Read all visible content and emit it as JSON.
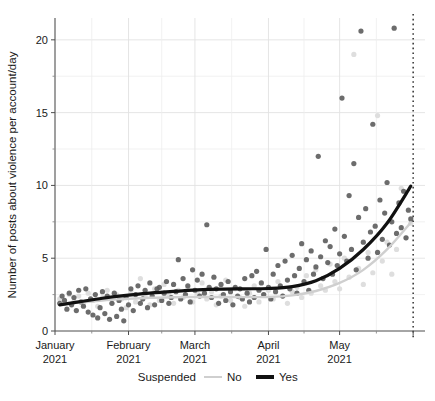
{
  "chart_data": {
    "type": "scatter",
    "title": "",
    "xlabel": "",
    "ylabel": "Number of posts about violence per account/day",
    "xlim": [
      "2021-01-01",
      "2021-06-05"
    ],
    "ylim": [
      0,
      21.5
    ],
    "grid": true,
    "y_ticks_major": [
      0,
      5,
      10,
      15,
      20
    ],
    "y_ticks_minor": [
      2.5,
      7.5,
      12.5,
      17.5
    ],
    "x_tick_labels": [
      {
        "label": "January",
        "sub": "2021",
        "value": "2021-01-01"
      },
      {
        "label": "February",
        "sub": "2021",
        "value": "2021-02-01"
      },
      {
        "label": "March",
        "sub": "2021",
        "value": "2021-03-01"
      },
      {
        "label": "April",
        "sub": "2021",
        "value": "2021-04-01"
      },
      {
        "label": "May",
        "sub": "2021",
        "value": "2021-05-01"
      }
    ],
    "legend": {
      "title": "Suspended",
      "position": "bottom",
      "entries": [
        {
          "label": "No",
          "color": "#cfcfcf",
          "line_width": 2
        },
        {
          "label": "Yes",
          "color": "#111111",
          "line_width": 4
        }
      ]
    },
    "annotations": [
      {
        "type": "vline",
        "x": "2021-06-01",
        "style": "dotted",
        "color": "#111111"
      }
    ],
    "series": [
      {
        "name": "Yes",
        "marker_color": "#5c5c5c",
        "line_color": "#111111",
        "points": [
          [
            2,
            1.9
          ],
          [
            3,
            2.4
          ],
          [
            4,
            2.1
          ],
          [
            5,
            1.5
          ],
          [
            6,
            2.6
          ],
          [
            7,
            1.8
          ],
          [
            8,
            2.3
          ],
          [
            9,
            1.4
          ],
          [
            10,
            2.8
          ],
          [
            11,
            2.0
          ],
          [
            12,
            1.7
          ],
          [
            13,
            2.9
          ],
          [
            14,
            1.3
          ],
          [
            15,
            2.2
          ],
          [
            16,
            1.1
          ],
          [
            17,
            2.5
          ],
          [
            18,
            0.9
          ],
          [
            19,
            1.6
          ],
          [
            20,
            2.7
          ],
          [
            21,
            1.2
          ],
          [
            22,
            2.4
          ],
          [
            23,
            0.8
          ],
          [
            24,
            1.9
          ],
          [
            25,
            2.6
          ],
          [
            26,
            1.0
          ],
          [
            27,
            2.1
          ],
          [
            28,
            1.5
          ],
          [
            29,
            0.7
          ],
          [
            30,
            2.3
          ],
          [
            31,
            1.8
          ],
          [
            32,
            2.9
          ],
          [
            33,
            1.4
          ],
          [
            34,
            2.5
          ],
          [
            35,
            3.1
          ],
          [
            36,
            1.9
          ],
          [
            37,
            2.2
          ],
          [
            38,
            2.8
          ],
          [
            39,
            1.6
          ],
          [
            40,
            3.3
          ],
          [
            41,
            2.4
          ],
          [
            42,
            1.8
          ],
          [
            43,
            2.9
          ],
          [
            44,
            3.0
          ],
          [
            45,
            2.1
          ],
          [
            46,
            2.6
          ],
          [
            47,
            3.4
          ],
          [
            48,
            1.9
          ],
          [
            49,
            2.3
          ],
          [
            50,
            3.2
          ],
          [
            51,
            2.7
          ],
          [
            52,
            4.9
          ],
          [
            53,
            2.2
          ],
          [
            54,
            3.6
          ],
          [
            55,
            2.5
          ],
          [
            56,
            3.1
          ],
          [
            57,
            2.0
          ],
          [
            58,
            4.2
          ],
          [
            59,
            2.8
          ],
          [
            60,
            3.5
          ],
          [
            61,
            2.4
          ],
          [
            62,
            3.9
          ],
          [
            63,
            2.6
          ],
          [
            64,
            7.3
          ],
          [
            65,
            3.0
          ],
          [
            66,
            2.3
          ],
          [
            67,
            3.7
          ],
          [
            68,
            2.9
          ],
          [
            69,
            1.9
          ],
          [
            70,
            3.2
          ],
          [
            71,
            2.5
          ],
          [
            72,
            2.1
          ],
          [
            73,
            3.4
          ],
          [
            74,
            2.7
          ],
          [
            75,
            1.8
          ],
          [
            76,
            3.0
          ],
          [
            77,
            2.4
          ],
          [
            78,
            2.9
          ],
          [
            79,
            2.2
          ],
          [
            80,
            3.6
          ],
          [
            81,
            2.6
          ],
          [
            82,
            2.0
          ],
          [
            83,
            3.8
          ],
          [
            84,
            2.3
          ],
          [
            85,
            4.1
          ],
          [
            86,
            2.8
          ],
          [
            87,
            3.3
          ],
          [
            88,
            2.5
          ],
          [
            89,
            5.6
          ],
          [
            90,
            3.0
          ],
          [
            91,
            2.2
          ],
          [
            92,
            3.9
          ],
          [
            93,
            2.7
          ],
          [
            94,
            4.5
          ],
          [
            95,
            3.1
          ],
          [
            96,
            2.4
          ],
          [
            97,
            4.8
          ],
          [
            98,
            3.5
          ],
          [
            99,
            2.9
          ],
          [
            100,
            5.2
          ],
          [
            101,
            3.8
          ],
          [
            102,
            2.6
          ],
          [
            103,
            4.3
          ],
          [
            104,
            6.0
          ],
          [
            105,
            3.4
          ],
          [
            106,
            4.9
          ],
          [
            107,
            2.8
          ],
          [
            108,
            5.5
          ],
          [
            109,
            3.9
          ],
          [
            110,
            4.4
          ],
          [
            111,
            12.0
          ],
          [
            112,
            5.1
          ],
          [
            113,
            3.6
          ],
          [
            114,
            6.2
          ],
          [
            115,
            4.7
          ],
          [
            116,
            5.8
          ],
          [
            117,
            3.9
          ],
          [
            118,
            7.0
          ],
          [
            119,
            4.5
          ],
          [
            120,
            5.3
          ],
          [
            121,
            16.0
          ],
          [
            122,
            6.5
          ],
          [
            123,
            4.8
          ],
          [
            124,
            9.3
          ],
          [
            125,
            5.6
          ],
          [
            126,
            11.5
          ],
          [
            127,
            4.2
          ],
          [
            128,
            7.8
          ],
          [
            129,
            20.6
          ],
          [
            130,
            6.1
          ],
          [
            131,
            8.4
          ],
          [
            132,
            5.0
          ],
          [
            133,
            6.8
          ],
          [
            134,
            14.2
          ],
          [
            135,
            7.2
          ],
          [
            136,
            5.4
          ],
          [
            137,
            9.0
          ],
          [
            138,
            6.3
          ],
          [
            139,
            8.1
          ],
          [
            140,
            10.2
          ],
          [
            141,
            5.9
          ],
          [
            142,
            7.5
          ],
          [
            143,
            20.8
          ],
          [
            144,
            6.7
          ],
          [
            145,
            8.8
          ],
          [
            146,
            7.1
          ],
          [
            147,
            9.6
          ],
          [
            148,
            6.4
          ],
          [
            149,
            8.3
          ],
          [
            150,
            7.7
          ]
        ]
      },
      {
        "name": "No",
        "marker_color": "#dcdcdc",
        "line_color": "#cfcfcf",
        "points": [
          [
            2,
            2.2
          ],
          [
            4,
            1.9
          ],
          [
            6,
            2.5
          ],
          [
            8,
            2.0
          ],
          [
            10,
            2.4
          ],
          [
            12,
            1.8
          ],
          [
            14,
            2.6
          ],
          [
            16,
            2.1
          ],
          [
            18,
            1.7
          ],
          [
            20,
            2.3
          ],
          [
            22,
            2.8
          ],
          [
            24,
            1.9
          ],
          [
            26,
            2.5
          ],
          [
            28,
            2.2
          ],
          [
            30,
            1.6
          ],
          [
            32,
            2.7
          ],
          [
            34,
            2.0
          ],
          [
            36,
            3.6
          ],
          [
            38,
            2.4
          ],
          [
            40,
            1.8
          ],
          [
            42,
            2.9
          ],
          [
            44,
            2.1
          ],
          [
            46,
            3.2
          ],
          [
            48,
            2.5
          ],
          [
            50,
            1.9
          ],
          [
            52,
            2.8
          ],
          [
            54,
            2.3
          ],
          [
            56,
            3.0
          ],
          [
            58,
            2.0
          ],
          [
            60,
            2.6
          ],
          [
            62,
            3.3
          ],
          [
            64,
            2.2
          ],
          [
            66,
            2.7
          ],
          [
            68,
            1.8
          ],
          [
            70,
            2.4
          ],
          [
            72,
            3.5
          ],
          [
            74,
            2.1
          ],
          [
            76,
            2.9
          ],
          [
            78,
            2.3
          ],
          [
            80,
            1.7
          ],
          [
            82,
            2.6
          ],
          [
            84,
            3.1
          ],
          [
            86,
            2.0
          ],
          [
            88,
            2.5
          ],
          [
            90,
            2.8
          ],
          [
            92,
            2.2
          ],
          [
            94,
            3.4
          ],
          [
            96,
            2.4
          ],
          [
            98,
            1.9
          ],
          [
            100,
            2.7
          ],
          [
            102,
            3.0
          ],
          [
            104,
            2.3
          ],
          [
            106,
            3.8
          ],
          [
            108,
            2.6
          ],
          [
            110,
            4.2
          ],
          [
            112,
            3.1
          ],
          [
            114,
            2.8
          ],
          [
            116,
            4.6
          ],
          [
            118,
            3.4
          ],
          [
            120,
            2.9
          ],
          [
            122,
            5.0
          ],
          [
            124,
            3.7
          ],
          [
            126,
            19.0
          ],
          [
            128,
            4.3
          ],
          [
            130,
            3.2
          ],
          [
            132,
            5.4
          ],
          [
            134,
            4.0
          ],
          [
            136,
            14.8
          ],
          [
            138,
            4.8
          ],
          [
            140,
            6.1
          ],
          [
            142,
            3.9
          ],
          [
            144,
            5.6
          ],
          [
            146,
            9.8
          ],
          [
            148,
            6.4
          ],
          [
            150,
            7.4
          ]
        ]
      }
    ],
    "trend_lines": [
      {
        "name": "Yes",
        "color": "#111111",
        "width": 3.2,
        "points": [
          [
            2,
            1.8
          ],
          [
            10,
            2.0
          ],
          [
            20,
            2.25
          ],
          [
            30,
            2.45
          ],
          [
            40,
            2.6
          ],
          [
            50,
            2.72
          ],
          [
            60,
            2.82
          ],
          [
            70,
            2.88
          ],
          [
            80,
            2.9
          ],
          [
            90,
            2.92
          ],
          [
            100,
            3.05
          ],
          [
            110,
            3.45
          ],
          [
            120,
            4.3
          ],
          [
            130,
            5.6
          ],
          [
            140,
            7.4
          ],
          [
            150,
            9.95
          ]
        ]
      },
      {
        "name": "No",
        "color": "#cfcfcf",
        "width": 2.4,
        "points": [
          [
            2,
            1.85
          ],
          [
            10,
            1.95
          ],
          [
            20,
            2.1
          ],
          [
            30,
            2.2
          ],
          [
            40,
            2.28
          ],
          [
            50,
            2.32
          ],
          [
            60,
            2.34
          ],
          [
            70,
            2.34
          ],
          [
            80,
            2.33
          ],
          [
            90,
            2.34
          ],
          [
            100,
            2.45
          ],
          [
            110,
            2.75
          ],
          [
            120,
            3.3
          ],
          [
            130,
            4.2
          ],
          [
            140,
            5.6
          ],
          [
            150,
            7.45
          ]
        ]
      }
    ]
  }
}
